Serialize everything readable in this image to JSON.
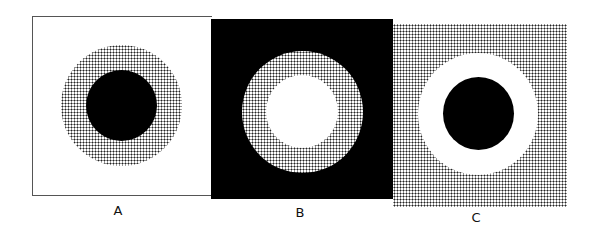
{
  "figure": {
    "panels": [
      {
        "label": "A",
        "background": "white",
        "outer_ring": "dotted-gray",
        "center_disk": "black"
      },
      {
        "label": "B",
        "background": "black",
        "outer_ring": "dotted-gray",
        "center_disk": "white"
      },
      {
        "label": "C",
        "background": "dotted-gray",
        "outer_ring": "white",
        "center_disk": "black"
      }
    ]
  },
  "colors": {
    "black": "#000000",
    "white": "#ffffff",
    "dot": "#222222"
  }
}
